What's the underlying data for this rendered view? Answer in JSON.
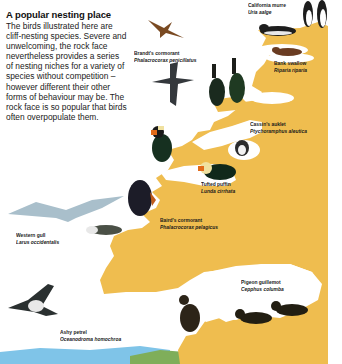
{
  "intro": {
    "title": "A popular nesting place",
    "body": "The birds illustrated here are cliff-nesting species. Severe and unwelcoming, the rock face nevertheless provides a series of nesting niches for a variety of species without competition – however different their other forms of behaviour may be. The rock face is so popular that birds often overpopulate them."
  },
  "colors": {
    "cliff": "#efbd4f",
    "water": "#7fc4e8",
    "grass": "#7fae5a",
    "background": "#ffffff"
  },
  "species": [
    {
      "common": "California murre",
      "scientific": "Uria aalge"
    },
    {
      "common": "Brandt's cormorant",
      "scientific": "Phalacrocorax penicillatus"
    },
    {
      "common": "Bank swallow",
      "scientific": "Riparia riparia"
    },
    {
      "common": "Cassin's auklet",
      "scientific": "Ptychoramphus aleutica"
    },
    {
      "common": "Tufted puffin",
      "scientific": "Lunda cirrhata"
    },
    {
      "common": "Baird's cormorant",
      "scientific": "Phalacrocorax pelagicus"
    },
    {
      "common": "Western gull",
      "scientific": "Larus occidentalis"
    },
    {
      "common": "Pigeon guillemot",
      "scientific": "Cepphus columba"
    },
    {
      "common": "Ashy petrel",
      "scientific": "Oceanodroma homochroa"
    }
  ]
}
